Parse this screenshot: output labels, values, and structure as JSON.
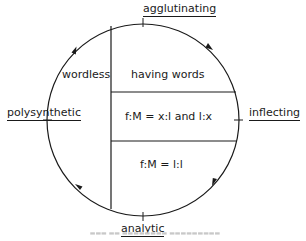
{
  "diagram": {
    "type": "cyclic typology diagram",
    "circle_labels": {
      "top": "agglutinating",
      "right": "inflecting",
      "bottom": "analytic",
      "left": "polysynthetic"
    },
    "regions": {
      "left": "wordless",
      "top_right": "having words",
      "middle_right": "f:M = x:l and l:x",
      "bottom_right": "f:M = l:l"
    },
    "direction": "clockwise",
    "arrows": [
      "upper-left arc (up)",
      "upper-right arc (down)",
      "lower-right arc (down-left)",
      "lower-left arc (up-left)"
    ],
    "caption": "(blurred, illegible)"
  }
}
